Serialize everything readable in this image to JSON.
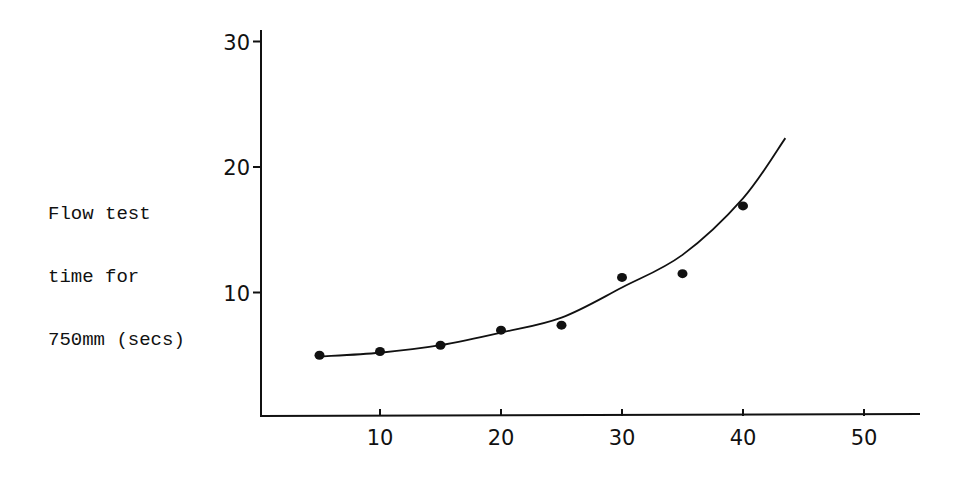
{
  "chart_data": {
    "type": "scatter",
    "title": "",
    "xlabel": "",
    "ylabel": "Flow test time for 750mm (secs)",
    "ylabel_lines": [
      "Flow test",
      "time for",
      "750mm (secs)"
    ],
    "xlim": [
      0,
      55
    ],
    "ylim": [
      0,
      30
    ],
    "x_ticks": [
      10,
      20,
      30,
      40,
      50
    ],
    "y_ticks": [
      10,
      20,
      30
    ],
    "x_tick_labels": [
      "10",
      "20",
      "30",
      "40",
      "50"
    ],
    "y_tick_labels": [
      "10",
      "20",
      "30"
    ],
    "grid": false,
    "legend": null,
    "series": [
      {
        "name": "measured points",
        "type": "scatter",
        "x": [
          5,
          10,
          15,
          20,
          25,
          30,
          35,
          40
        ],
        "y": [
          5.0,
          5.3,
          5.8,
          7.0,
          7.4,
          11.2,
          11.5,
          16.9
        ]
      },
      {
        "name": "fitted curve",
        "type": "line",
        "x": [
          5,
          10,
          15,
          20,
          25,
          30,
          35,
          40,
          43.5
        ],
        "y": [
          4.9,
          5.2,
          5.8,
          6.8,
          8.0,
          10.4,
          13.0,
          17.5,
          22.3
        ]
      }
    ]
  }
}
